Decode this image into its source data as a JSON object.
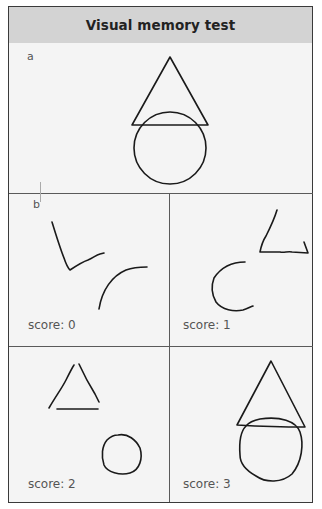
{
  "header": {
    "title": "Visual memory test"
  },
  "panel_a": {
    "label": "a"
  },
  "panel_b": {
    "label": "b",
    "cells": [
      {
        "score_label": "score: 0",
        "score": 0
      },
      {
        "score_label": "score: 1",
        "score": 1
      },
      {
        "score_label": "score: 2",
        "score": 2
      },
      {
        "score_label": "score: 3",
        "score": 3
      }
    ]
  },
  "colors": {
    "header_bg": "#d3d3d3",
    "panel_bg": "#f4f4f4",
    "stroke": "#1a1a1a",
    "border": "#3a3a3a"
  }
}
